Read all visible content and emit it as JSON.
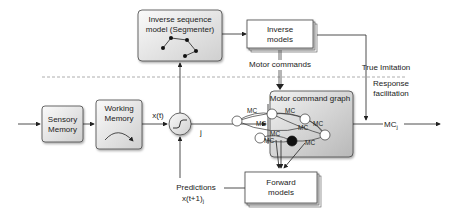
{
  "diagram": {
    "boxes": {
      "inverse_sequence_model": {
        "line1": "Inverse sequence",
        "line2": "model (Segmenter)"
      },
      "inverse_models": {
        "line1": "Inverse",
        "line2": "models"
      },
      "sensory_memory": {
        "line1": "Sensory",
        "line2": "Memory"
      },
      "working_memory": {
        "line1": "Working",
        "line2": "Memory"
      },
      "motor_command_graph": {
        "title": "Motor command graph",
        "edge_label": "MC"
      },
      "forward_models": {
        "line1": "Forward",
        "line2": "models"
      }
    },
    "labels": {
      "motor_commands": "Motor commands",
      "true_imitation": "True Imitation",
      "response_facilitation_1": "Response",
      "response_facilitation_2": "facilitation",
      "x_t": "x(t)",
      "j": "j",
      "predictions": "Predictions",
      "x_t1": "x(t+1)",
      "x_t1_sub": "j",
      "mc_out": "MC",
      "mc_out_sub": "j"
    },
    "colors": {
      "box_light": "#f4f4f4",
      "box_dark": "#cfcfcf",
      "stroke": "#333333",
      "dash": "#999999"
    }
  }
}
